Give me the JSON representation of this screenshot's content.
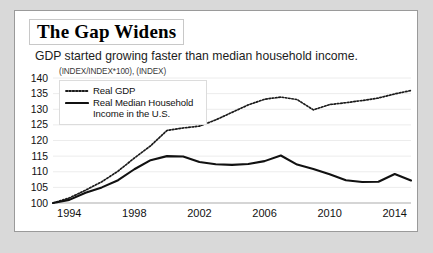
{
  "card": {
    "title": "The Gap Widens",
    "subtitle": "GDP started growing faster than median household income.",
    "units_label": "(INDEX/INDEX*100), (INDEX)"
  },
  "legend": {
    "items": [
      {
        "label": "Real GDP",
        "style": "dotted",
        "color": "#1a1a1a"
      },
      {
        "label": "Real Median Household Income in the U.S.",
        "style": "solid",
        "color": "#111111"
      }
    ]
  },
  "chart_data": {
    "type": "line",
    "title": "The Gap Widens",
    "subtitle": "GDP started growing faster than median household income.",
    "xlabel": "",
    "ylabel": "(INDEX/INDEX*100), (INDEX)",
    "xlim": [
      1993,
      2015
    ],
    "ylim": [
      100,
      140
    ],
    "yticks": [
      100,
      105,
      110,
      115,
      120,
      125,
      130,
      135,
      140
    ],
    "xticks": [
      1994,
      1998,
      2002,
      2006,
      2010,
      2014
    ],
    "grid": true,
    "legend_position": "upper-left",
    "x": [
      1993,
      1994,
      1995,
      1996,
      1997,
      1998,
      1999,
      2000,
      2001,
      2002,
      2003,
      2004,
      2005,
      2006,
      2007,
      2008,
      2009,
      2010,
      2011,
      2012,
      2013,
      2014,
      2015
    ],
    "series": [
      {
        "name": "Real GDP",
        "style": "dotted",
        "color": "#1a1a1a",
        "values": [
          100.0,
          101.6,
          104.1,
          106.8,
          110.2,
          114.4,
          118.3,
          123.2,
          124.0,
          124.6,
          126.6,
          129.0,
          131.4,
          133.2,
          133.9,
          133.1,
          129.8,
          131.5,
          132.1,
          132.8,
          133.6,
          134.9,
          136.0
        ]
      },
      {
        "name": "Real Median Household Income in the U.S.",
        "style": "solid",
        "color": "#111111",
        "values": [
          100.0,
          101.0,
          103.3,
          105.0,
          107.3,
          110.8,
          113.7,
          115.0,
          114.9,
          113.1,
          112.4,
          112.2,
          112.5,
          113.4,
          115.2,
          112.3,
          110.9,
          109.2,
          107.3,
          106.7,
          106.8,
          109.3,
          107.2
        ]
      }
    ]
  }
}
